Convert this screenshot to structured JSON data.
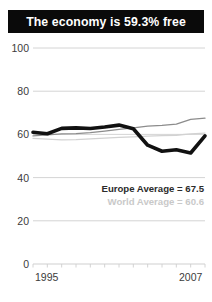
{
  "title": {
    "text": "The economy is 59.3% free"
  },
  "legend": {
    "europe_label": "Europe Average = 67.5",
    "world_label": "World Average = 60.6"
  },
  "colors": {
    "banner_background": "#0a0a0a",
    "banner_text": "#ffffff",
    "country_line": "#111111",
    "europe_line": "#8c8c8c",
    "world_line": "#d2d2d2",
    "gridline": "#cfcfcf",
    "tick_text": "#3b3b3b",
    "legend_europe_text": "#2b2b2b",
    "legend_world_text": "#c9c9c9"
  },
  "chart_data": {
    "type": "line",
    "title": "The economy is 59.3% free",
    "xlabel": "",
    "ylabel": "",
    "xlim": [
      1995,
      2007
    ],
    "ylim": [
      0,
      100
    ],
    "yticks": [
      0,
      20,
      40,
      60,
      80,
      100
    ],
    "ytick_labels": [
      "0",
      "20",
      "40",
      "60",
      "80",
      "100"
    ],
    "xticks": [
      1995,
      2007
    ],
    "xtick_labels": [
      "1995",
      "2007"
    ],
    "grid": true,
    "grid_axis": "y",
    "legend_position": "inside-lower-right",
    "x": [
      1995,
      1996,
      1997,
      1998,
      1999,
      2000,
      2001,
      2002,
      2003,
      2004,
      2005,
      2006,
      2007
    ],
    "series": [
      {
        "name": "Country",
        "style": "thick-black",
        "color": "#111111",
        "values": [
          61.0,
          60.3,
          62.8,
          63.0,
          62.7,
          63.4,
          64.3,
          62.6,
          55.0,
          52.2,
          52.9,
          51.4,
          59.3
        ]
      },
      {
        "name": "Europe Average",
        "style": "medium-gray",
        "color": "#8c8c8c",
        "final_value": 67.5,
        "values": [
          59.3,
          59.8,
          60.2,
          60.4,
          60.8,
          61.5,
          62.3,
          63.0,
          63.8,
          64.2,
          64.8,
          67.0,
          67.5
        ]
      },
      {
        "name": "World Average",
        "style": "light-gray",
        "color": "#d2d2d2",
        "final_value": 60.6,
        "values": [
          58.2,
          57.8,
          57.5,
          57.6,
          57.9,
          58.3,
          58.6,
          58.9,
          59.2,
          59.4,
          59.6,
          60.2,
          60.6
        ]
      }
    ]
  }
}
